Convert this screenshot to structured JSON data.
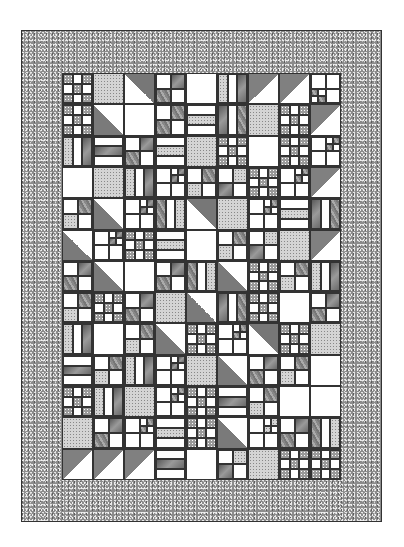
{
  "image": {
    "subject": "quilt-pattern",
    "colors": {
      "border": "#8c8c8c",
      "line": "#333333",
      "background": "#ffffff",
      "light": "#ffffff"
    },
    "layout": {
      "columns": 9,
      "rows": 13
    }
  },
  "blocks": [
    [
      "np",
      "sp",
      "hstTL",
      "qp",
      "w",
      "rv",
      "hstBL",
      "hstBL",
      "qpR"
    ],
    [
      "np",
      "hstTR",
      "w",
      "qpX",
      "rh",
      "rv",
      "sp",
      "np",
      "hstBL"
    ],
    [
      "rv",
      "rh",
      "qp2",
      "rh",
      "sp",
      "np",
      "w",
      "np",
      "qpS"
    ],
    [
      "w",
      "sp",
      "rv",
      "qpS",
      "qp",
      "qp",
      "np",
      "qpS",
      "hstBL"
    ],
    [
      "qp",
      "hstTR",
      "qpS",
      "rv",
      "hstTL",
      "sp",
      "qpS",
      "rh",
      "rv"
    ],
    [
      "hstTR",
      "qpS",
      "np",
      "rh",
      "w",
      "qp",
      "qp",
      "sp",
      "hstBL"
    ],
    [
      "qp",
      "hstTR",
      "w",
      "qp",
      "rv",
      "hstTR",
      "np",
      "qp",
      "rv"
    ],
    [
      "qp",
      "np",
      "qp",
      "sp",
      "hstTR",
      "rv",
      "np",
      "w",
      "qp"
    ],
    [
      "rv",
      "w",
      "qp",
      "hstTR",
      "np",
      "qpS",
      "hstTL",
      "np",
      "sp"
    ],
    [
      "rh",
      "qp",
      "rv",
      "qpS",
      "sp",
      "hstTR",
      "qp",
      "qp",
      "w"
    ],
    [
      "np",
      "rv",
      "sp",
      "qpS",
      "np",
      "rh",
      "qp",
      "w",
      "w"
    ],
    [
      "sp",
      "qp",
      "qpS",
      "rh",
      "np",
      "hstTR",
      "qpS",
      "qp",
      "rv"
    ],
    [
      "hstBL",
      "hstBL",
      "hstBL",
      "rh",
      "w",
      "qp",
      "sp",
      "np",
      "np"
    ]
  ]
}
